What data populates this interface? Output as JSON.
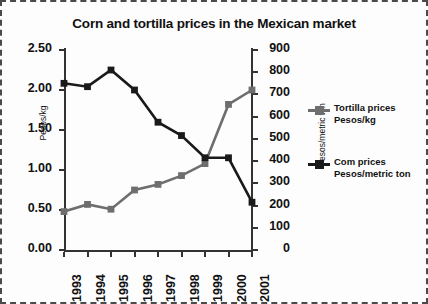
{
  "chart_data": {
    "type": "line",
    "title": "Corn and tortilla prices in the Mexican market",
    "xlabel": "",
    "ylabel": "Pesos/kg",
    "ylabel_right": "Pesos/metric ton",
    "categories": [
      "1993",
      "1994",
      "1995",
      "1996",
      "1997",
      "1998",
      "1999",
      "2000",
      "2001"
    ],
    "ylim": [
      0,
      2.5
    ],
    "ylim_right": [
      0,
      900
    ],
    "yticks": [
      "0.00",
      "0.50",
      "1.00",
      "1.50",
      "2.00",
      "2.50"
    ],
    "yticks_right": [
      "0",
      "100",
      "200",
      "300",
      "400",
      "500",
      "600",
      "700",
      "800",
      "900"
    ],
    "grid": false,
    "legend_position": "right",
    "series": [
      {
        "name": "Tortilla prices",
        "unit": "Pesos/kg",
        "axis": "left",
        "color": "#6e6e6e",
        "values": [
          0.48,
          0.57,
          0.51,
          0.75,
          0.82,
          0.93,
          1.08,
          1.82,
          2.0
        ]
      },
      {
        "name": "Corn prices",
        "unit": "Pesos/metric ton",
        "axis": "right",
        "color": "#1a1a1a",
        "values": [
          750,
          735,
          810,
          720,
          575,
          515,
          415,
          415,
          215
        ]
      }
    ]
  },
  "legend": {
    "items": [
      {
        "line1": "Tortilla prices",
        "line2": "Pesos/kg"
      },
      {
        "line1": "Com prices",
        "line2": "Pesos/metric ton"
      }
    ]
  }
}
